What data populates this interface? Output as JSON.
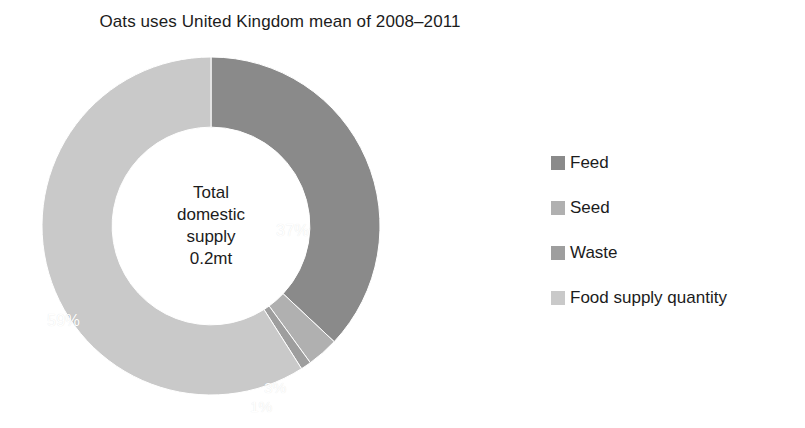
{
  "chart_data": {
    "type": "pie",
    "variant": "donut",
    "title": "Oats uses United Kingdom mean of 2008–2011",
    "categories": [
      "Feed",
      "Seed",
      "Waste",
      "Food supply quantity"
    ],
    "values": [
      37,
      3,
      1,
      59
    ],
    "value_labels": [
      "37%",
      "3%",
      "1%",
      "59%"
    ],
    "units": "percent",
    "colors": [
      "#8a8a8a",
      "#b0b0b0",
      "#9e9e9e",
      "#c9c9c9"
    ],
    "start_angle_deg": 0,
    "direction": "clockwise",
    "hole_fraction": 0.585,
    "legend_position": "right",
    "grid": false,
    "center_annotation": {
      "line1": "Total",
      "line2": "domestic",
      "line3": "supply",
      "line4": "0.2mt"
    }
  },
  "legend": {
    "items": [
      {
        "label": "Feed",
        "color": "#8a8a8a"
      },
      {
        "label": "Seed",
        "color": "#b0b0b0"
      },
      {
        "label": "Waste",
        "color": "#9e9e9e"
      },
      {
        "label": "Food supply quantity",
        "color": "#c9c9c9"
      }
    ]
  }
}
